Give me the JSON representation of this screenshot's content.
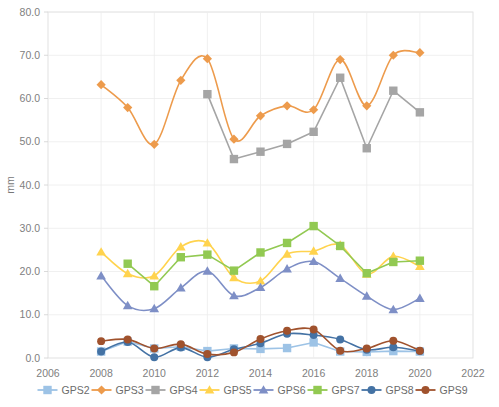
{
  "chart_data": {
    "type": "line",
    "title": "",
    "xlabel": "",
    "ylabel": "mm",
    "xlim": [
      2006,
      2022
    ],
    "ylim": [
      0.0,
      80.0
    ],
    "ytick_labels": [
      "0.0",
      "10.0",
      "20.0",
      "30.0",
      "40.0",
      "50.0",
      "60.0",
      "70.0",
      "80.0"
    ],
    "ytick_values": [
      0,
      10,
      20,
      30,
      40,
      50,
      60,
      70,
      80
    ],
    "xtick_labels": [
      "2006",
      "2008",
      "2010",
      "2012",
      "2014",
      "2016",
      "2018",
      "2020",
      "2022"
    ],
    "xtick_values": [
      2006,
      2008,
      2010,
      2012,
      2014,
      2016,
      2018,
      2020,
      2022
    ],
    "grid": true,
    "legend_position": "bottom",
    "x": [
      2008,
      2009,
      2010,
      2011,
      2012,
      2013,
      2014,
      2015,
      2016,
      2017,
      2018,
      2019,
      2020
    ],
    "series": [
      {
        "name": "GPS2",
        "color": "#9DC3E6",
        "marker": "square",
        "values": [
          1.5,
          3.8,
          2.2,
          2.6,
          1.6,
          2.2,
          2.1,
          2.3,
          3.6,
          1.5,
          1.4,
          1.6,
          1.5
        ]
      },
      {
        "name": "GPS3",
        "color": "#ED9B4C",
        "marker": "diamond",
        "values": [
          63.2,
          57.9,
          49.4,
          64.2,
          69.2,
          50.6,
          56.0,
          58.3,
          57.4,
          69.0,
          58.3,
          70.0,
          70.6
        ]
      },
      {
        "name": "GPS4",
        "color": "#A5A5A5",
        "marker": "square",
        "values": [
          null,
          null,
          null,
          null,
          61.0,
          46.0,
          47.7,
          49.5,
          52.3,
          64.8,
          48.5,
          61.8,
          56.8
        ]
      },
      {
        "name": "GPS5",
        "color": "#FFD34E",
        "marker": "triangle",
        "values": [
          24.5,
          19.5,
          19.0,
          25.7,
          26.6,
          18.6,
          17.8,
          24.0,
          24.7,
          26.1,
          19.4,
          23.5,
          21.2
        ]
      },
      {
        "name": "GPS6",
        "color": "#7E8FC6",
        "marker": "triangle",
        "values": [
          19.0,
          12.1,
          11.4,
          16.2,
          20.1,
          14.4,
          16.3,
          20.6,
          22.3,
          18.4,
          14.3,
          11.2,
          13.8
        ]
      },
      {
        "name": "GPS7",
        "color": "#92C952",
        "marker": "square",
        "values": [
          null,
          21.8,
          16.6,
          23.3,
          23.9,
          20.2,
          24.4,
          26.6,
          30.5,
          25.9,
          19.6,
          22.2,
          22.5
        ]
      },
      {
        "name": "GPS8",
        "color": "#4472A4",
        "marker": "circle",
        "values": [
          1.5,
          3.7,
          0.2,
          2.4,
          0.2,
          2.0,
          3.4,
          5.6,
          5.3,
          4.3,
          1.9,
          2.5,
          1.6
        ]
      },
      {
        "name": "GPS9",
        "color": "#A0522D",
        "marker": "circle",
        "values": [
          3.9,
          4.3,
          2.2,
          3.2,
          0.9,
          1.3,
          4.4,
          6.3,
          6.6,
          1.7,
          2.2,
          4.0,
          1.7
        ]
      }
    ]
  },
  "legend": {
    "items": [
      {
        "label": "GPS2"
      },
      {
        "label": "GPS3"
      },
      {
        "label": "GPS4"
      },
      {
        "label": "GPS5"
      },
      {
        "label": "GPS6"
      },
      {
        "label": "GPS7"
      },
      {
        "label": "GPS8"
      },
      {
        "label": "GPS9"
      }
    ]
  }
}
